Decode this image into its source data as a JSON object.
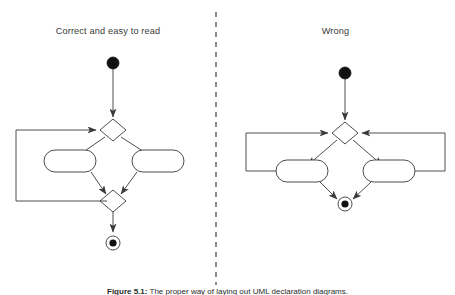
{
  "figure": {
    "type": "uml-activity-diagram-comparison",
    "background_color": "#ffffff",
    "line_color": "#3a3a3a",
    "node_fill_color": "#000000",
    "text_color": "#3a3a3a",
    "caption": {
      "label": "Figure 5.1:",
      "text": "The proper way of laying out UML declaration diagrams.",
      "full": "Figure 5.1: The proper way of laying out UML declaration diagrams.",
      "truncated_at_image_edge": true
    },
    "divider": {
      "name": "vertical-dashed-divider",
      "style": "dashed",
      "x": 216,
      "y_start": 12,
      "y_end": 285
    }
  },
  "panels": [
    {
      "id": "left",
      "title": "Correct and easy to read",
      "verdict": "correct",
      "layout": "vertical-flow-with-left-side-loopback",
      "nodes": [
        {
          "name": "initial-node",
          "type": "initial",
          "x": 113,
          "y": 63,
          "r": 6
        },
        {
          "name": "decision-node",
          "type": "decision",
          "x": 113,
          "y": 130,
          "w": 26,
          "h": 22
        },
        {
          "name": "action-node-left",
          "type": "action",
          "x": 70,
          "y": 161,
          "w": 52,
          "h": 22
        },
        {
          "name": "action-node-right",
          "type": "action",
          "x": 158,
          "y": 161,
          "w": 52,
          "h": 22
        },
        {
          "name": "merge-node",
          "type": "merge",
          "x": 113,
          "y": 201,
          "w": 26,
          "h": 22
        },
        {
          "name": "final-node",
          "type": "final",
          "x": 113,
          "y": 243,
          "r": 7
        }
      ],
      "edges": [
        {
          "name": "edge-initial-to-decision",
          "from": "initial-node",
          "to": "decision-node"
        },
        {
          "name": "edge-decision-to-action-left",
          "from": "decision-node",
          "to": "action-node-left"
        },
        {
          "name": "edge-decision-to-action-right",
          "from": "decision-node",
          "to": "action-node-right"
        },
        {
          "name": "edge-action-left-to-merge",
          "from": "action-node-left",
          "to": "merge-node"
        },
        {
          "name": "edge-action-right-to-merge",
          "from": "action-node-right",
          "to": "merge-node"
        },
        {
          "name": "edge-merge-to-final",
          "from": "merge-node",
          "to": "final-node"
        },
        {
          "name": "edge-loopback-to-decision",
          "from": "merge-node",
          "to": "decision-node",
          "routing": "left-rectangular-loop"
        }
      ]
    },
    {
      "id": "right",
      "title": "Wrong",
      "verdict": "wrong",
      "layout": "crossing-loopbacks-on-both-sides",
      "nodes": [
        {
          "name": "initial-node",
          "type": "initial",
          "x": 345,
          "y": 73,
          "r": 6
        },
        {
          "name": "decision-node",
          "type": "decision",
          "x": 345,
          "y": 133,
          "w": 26,
          "h": 22
        },
        {
          "name": "action-node-left",
          "type": "action",
          "x": 302,
          "y": 171,
          "w": 52,
          "h": 22
        },
        {
          "name": "action-node-right",
          "type": "action",
          "x": 389,
          "y": 171,
          "w": 52,
          "h": 22
        },
        {
          "name": "final-node",
          "type": "final",
          "x": 345,
          "y": 204,
          "r": 7
        }
      ],
      "edges": [
        {
          "name": "edge-initial-to-decision",
          "from": "initial-node",
          "to": "decision-node"
        },
        {
          "name": "edge-decision-to-action-left",
          "from": "decision-node",
          "to": "action-node-left"
        },
        {
          "name": "edge-decision-to-action-right",
          "from": "decision-node",
          "to": "action-node-right"
        },
        {
          "name": "edge-action-left-to-final",
          "from": "action-node-left",
          "to": "final-node"
        },
        {
          "name": "edge-action-right-to-final",
          "from": "action-node-right",
          "to": "final-node"
        },
        {
          "name": "edge-loopback-left",
          "from": "action-node-left",
          "to": "decision-node",
          "routing": "far-left-rectangular-loop"
        },
        {
          "name": "edge-loopback-right",
          "from": "action-node-right",
          "to": "decision-node",
          "routing": "far-right-rectangular-loop"
        }
      ]
    }
  ]
}
